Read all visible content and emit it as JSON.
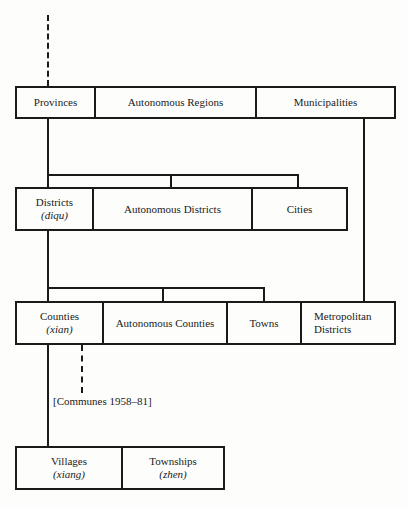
{
  "diagram": {
    "level1": {
      "cells": [
        {
          "label": "Provinces"
        },
        {
          "label": "Autonomous Regions"
        },
        {
          "label": "Municipalities"
        }
      ]
    },
    "level2": {
      "cells": [
        {
          "label": "Districts",
          "sub": "(diqu)"
        },
        {
          "label": "Autonomous Districts"
        },
        {
          "label": "Cities"
        }
      ]
    },
    "level3": {
      "cells": [
        {
          "label": "Counties",
          "sub": "(xian)"
        },
        {
          "label": "Autonomous Counties"
        },
        {
          "label": "Towns"
        },
        {
          "label": "Metropolitan",
          "sub": "Districts"
        }
      ]
    },
    "communes_note": "[Communes 1958–81]",
    "level4": {
      "cells": [
        {
          "label": "Villages",
          "sub": "(xiang)"
        },
        {
          "label": "Townships",
          "sub": "(zhen)"
        }
      ]
    }
  }
}
